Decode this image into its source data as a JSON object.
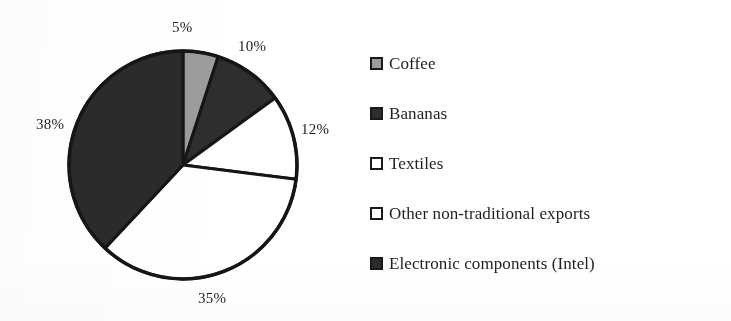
{
  "chart_data": {
    "type": "pie",
    "title": "",
    "subtitle": "",
    "xlabel": "",
    "ylabel": "",
    "grid": false,
    "legend_position": "right",
    "start_angle_deg": 0,
    "direction": "clockwise",
    "categories": [
      "Coffee",
      "Bananas",
      "Textiles",
      "Other non-traditional exports",
      "Electronic components (Intel)"
    ],
    "values": [
      5,
      10,
      12,
      35,
      38
    ],
    "value_unit": "%",
    "data_labels": [
      "5%",
      "10%",
      "12%",
      "35%",
      "38%"
    ],
    "slice_colors": [
      "#9c9c9c",
      "#2e2e2e",
      "#ffffff",
      "#ffffff",
      "#2b2b2b"
    ],
    "slice_border_color": "#161616",
    "slices": [
      {
        "label": "Coffee",
        "value": 5,
        "data_label": "5%",
        "color": "#9c9c9c"
      },
      {
        "label": "Bananas",
        "value": 10,
        "data_label": "10%",
        "color": "#2e2e2e"
      },
      {
        "label": "Textiles",
        "value": 12,
        "data_label": "12%",
        "color": "#ffffff"
      },
      {
        "label": "Other non-traditional exports",
        "value": 35,
        "data_label": "35%",
        "color": "#ffffff"
      },
      {
        "label": "Electronic components (Intel)",
        "value": 38,
        "data_label": "38%",
        "color": "#2b2b2b"
      }
    ]
  },
  "labels": {
    "coffee_pct": "5%",
    "bananas_pct": "10%",
    "textiles_pct": "12%",
    "other_pct": "35%",
    "electronics_pct": "38%"
  },
  "legend": {
    "items": [
      {
        "label": "Coffee",
        "swatch_color": "#9c9c9c",
        "swatch_border": "#1a1a1a"
      },
      {
        "label": "Bananas",
        "swatch_color": "#2e2e2e",
        "swatch_border": "#1a1a1a"
      },
      {
        "label": "Textiles",
        "swatch_color": "#ffffff",
        "swatch_border": "#1a1a1a"
      },
      {
        "label": "Other non-traditional exports",
        "swatch_color": "#ffffff",
        "swatch_border": "#1a1a1a"
      },
      {
        "label": "Electronic components (Intel)",
        "swatch_color": "#2b2b2b",
        "swatch_border": "#1a1a1a"
      }
    ]
  },
  "colors": {
    "background": "#ffffff",
    "text": "#1f1f1f",
    "outline": "#161616"
  }
}
